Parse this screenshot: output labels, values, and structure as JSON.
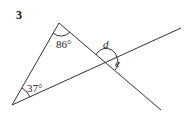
{
  "question_number": "3",
  "angles": {
    "top": "86°",
    "bottom_left": "37°",
    "d": "d",
    "e": "e"
  },
  "colors": {
    "line": "#333333",
    "background": "#ffffff"
  }
}
